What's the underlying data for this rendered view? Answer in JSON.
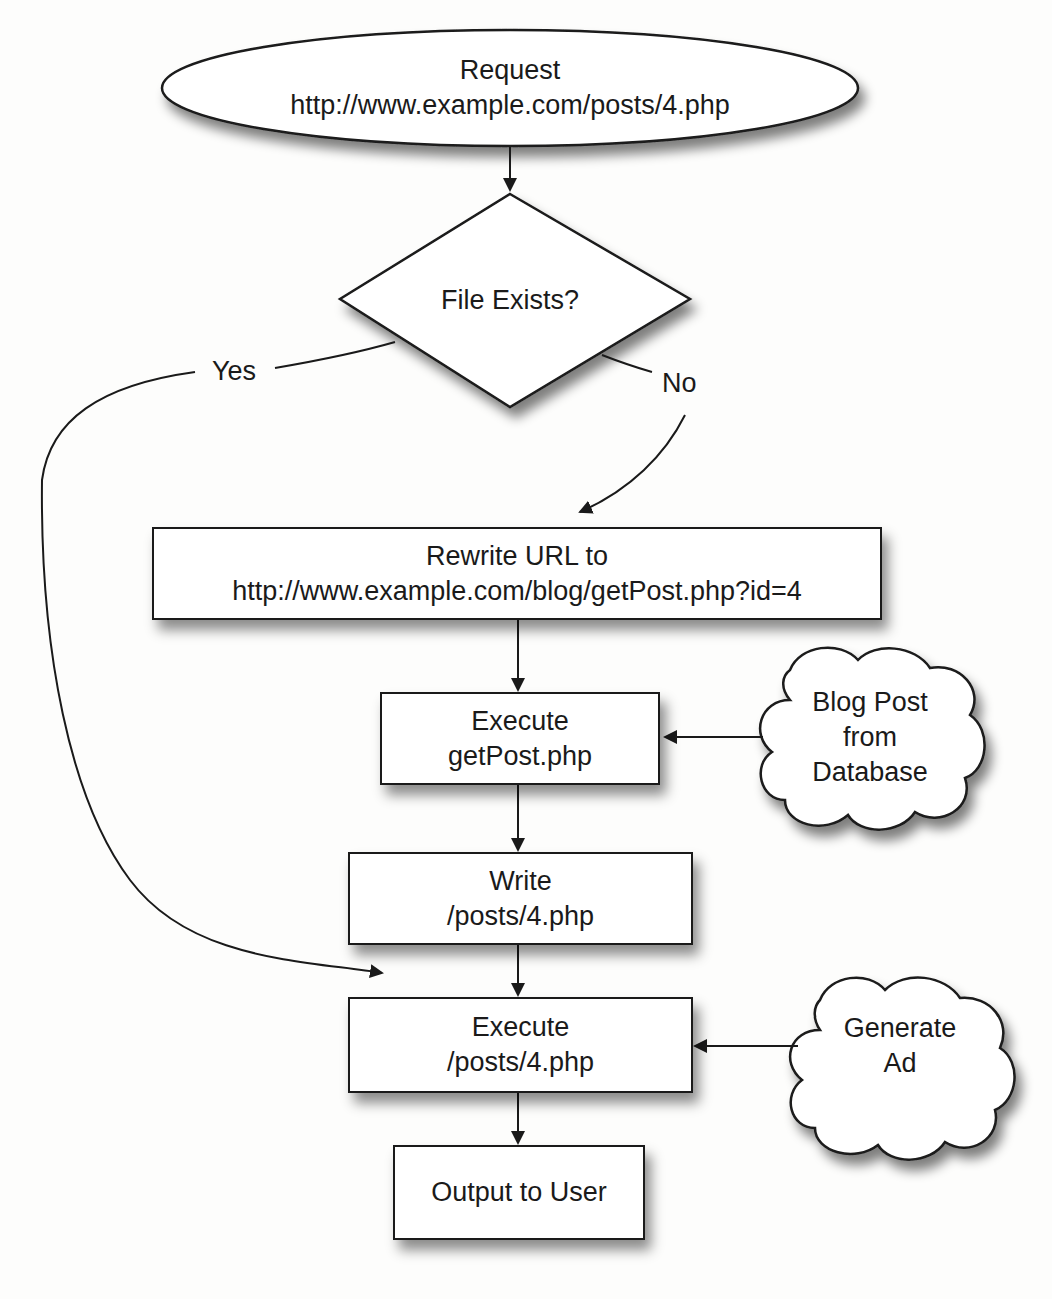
{
  "nodes": {
    "request": {
      "line1": "Request",
      "line2": "http://www.example.com/posts/4.php"
    },
    "decision": {
      "text": "File Exists?"
    },
    "rewrite": {
      "line1": "Rewrite URL to",
      "line2": "http://www.example.com/blog/getPost.php?id=4"
    },
    "execute_getpost": {
      "line1": "Execute",
      "line2": "getPost.php"
    },
    "blog_post_db": {
      "line1": "Blog Post",
      "line2": "from",
      "line3": "Database"
    },
    "write_post": {
      "line1": "Write",
      "line2": "/posts/4.php"
    },
    "execute_post": {
      "line1": "Execute",
      "line2": "/posts/4.php"
    },
    "generate_ad": {
      "line1": "Generate",
      "line2": "Ad"
    },
    "output": {
      "text": "Output to User"
    }
  },
  "edges": {
    "yes_label": "Yes",
    "no_label": "No"
  },
  "colors": {
    "stroke": "#1a1a1a",
    "fill": "#ffffff",
    "background": "#fdfdfc"
  }
}
